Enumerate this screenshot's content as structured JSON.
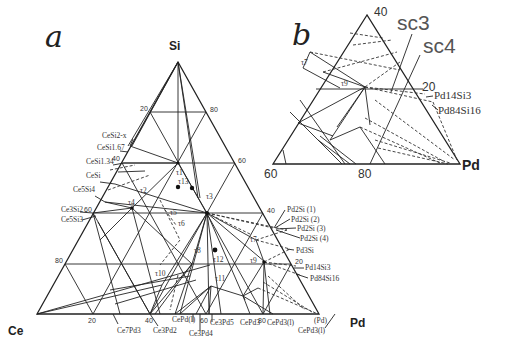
{
  "panel_a": {
    "letter": "a",
    "vertices": {
      "top": "Si",
      "left": "Ce",
      "right": "Pd"
    },
    "left_edge_ticks": [
      "20",
      "40",
      "60",
      "80"
    ],
    "right_edge_ticks": [
      "80",
      "60",
      "40",
      "20"
    ],
    "bottom_edge_ticks": [
      "20",
      "40",
      "60",
      "80"
    ],
    "left_phases": [
      "CeSi2-x",
      "CeSi1.67",
      "CeSi1.34",
      "CeSi",
      "Ce5Si4",
      "Ce3Si2",
      "Ce5Si3"
    ],
    "right_phases": [
      "Pd2Si (1)",
      "Pd2Si (2)",
      "Pd2Si (3)",
      "Pd2Si (4)",
      "Pd3Si",
      "Pd14Si3",
      "Pd84Si16"
    ],
    "bottom_phases": [
      "Ce7Pd3",
      "Ce3Pd2",
      "CePd(l)",
      "Ce3Pd4",
      "Ce3Pd5",
      "CePd3",
      "CePd3(l)",
      "CePd3(l)",
      "(Pd)"
    ],
    "ternary_compounds": [
      "τ1",
      "τ2",
      "τ3",
      "τ4",
      "τ5",
      "τ6",
      "τ7",
      "τ8",
      "τ9",
      "τ10",
      "τ11",
      "τ12",
      "τ13"
    ]
  },
  "panel_b": {
    "letter": "b",
    "vertex": "Pd",
    "ticks": {
      "top": "40",
      "right": "20",
      "bottom_left": "60",
      "bottom_mid": "80"
    },
    "annotations": [
      "sc3",
      "sc4"
    ],
    "phases": [
      "Pd14Si3",
      "Pd84Si16"
    ],
    "ternary_compounds": [
      "τ7",
      "τ9"
    ]
  }
}
